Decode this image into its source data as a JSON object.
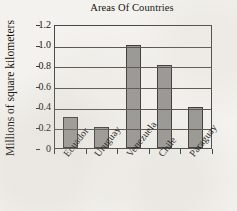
{
  "chart_data": {
    "type": "bar",
    "title": "Areas Of Countries",
    "xlabel": "",
    "ylabel": "Millions of square kilometers",
    "categories": [
      "Ecuador",
      "Uruguay",
      "Venezuela",
      "Chile",
      "Paraguay"
    ],
    "values": [
      0.3,
      0.2,
      1.0,
      0.8,
      0.4
    ],
    "ylim": [
      0,
      1.2
    ],
    "yticks": [
      0,
      0.2,
      0.4,
      0.6,
      0.8,
      1.0,
      1.2
    ],
    "ytick_labels": [
      "0",
      "0.2",
      "0.4",
      "0.6",
      "0.8",
      "1.0",
      "1.2"
    ],
    "grid": true,
    "grid_axis": "y",
    "legend": false,
    "bar_color": "#9a9895",
    "bar_edge_color": "#3d3b39",
    "axis_color": "#4a4744",
    "background_color": "#f4f2ee",
    "text_color": "#15120f"
  }
}
